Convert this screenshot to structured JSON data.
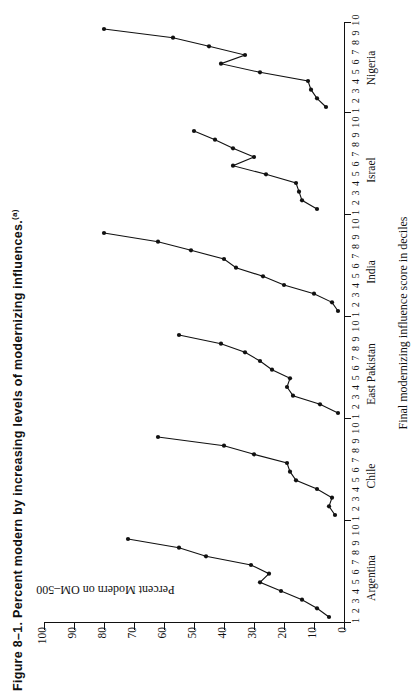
{
  "figure": {
    "number": "Figure 8–1.",
    "title": "Percent modern by increasing levels of modernizing influences.",
    "footnote_marker": "(a)"
  },
  "axes": {
    "y_label": "Percent Modern on OM–500",
    "x_label": "Final modernizing influence score in deciles",
    "y_ticks": [
      "100",
      "90",
      "80",
      "70",
      "60",
      "50",
      "40",
      "30",
      "20",
      "10",
      "0"
    ],
    "decile_labels": "1 2 3 4 5 6 7 8 9 10"
  },
  "chart_data": {
    "type": "line",
    "title": "Percent modern by increasing levels of modernizing influences.",
    "xlabel": "Final modernizing influence score in deciles",
    "ylabel": "Percent Modern on OM-500",
    "ylim": [
      0,
      100
    ],
    "xlim": [
      1,
      10
    ],
    "grid": false,
    "legend": "none",
    "panels": [
      {
        "name": "Argentina",
        "x": [
          1,
          2,
          3,
          4,
          5,
          6,
          7,
          8,
          9,
          10
        ],
        "values": [
          5,
          9,
          13,
          19,
          26,
          30,
          25,
          28,
          42,
          48,
          70
        ],
        "series": [
          {
            "name": "Argentina",
            "deciles": [
              1,
              2,
              3,
              4,
              5,
              6,
              7,
              8,
              9,
              10
            ],
            "values": [
              5,
              9,
              14,
              21,
              28,
              25,
              31,
              46,
              55,
              72
            ]
          }
        ]
      },
      {
        "name": "Chile",
        "series": [
          {
            "name": "Chile",
            "deciles": [
              1,
              2,
              3,
              4,
              5,
              6,
              7,
              8,
              9,
              10
            ],
            "values": [
              3,
              5,
              4,
              9,
              16,
              18,
              19,
              30,
              40,
              62
            ]
          }
        ]
      },
      {
        "name": "East Pakistan",
        "series": [
          {
            "name": "East Pakistan",
            "deciles": [
              1,
              2,
              3,
              4,
              5,
              6,
              7,
              8,
              9,
              10
            ],
            "values": [
              2,
              8,
              17,
              19,
              18,
              24,
              28,
              33,
              41,
              55
            ]
          }
        ]
      },
      {
        "name": "India",
        "series": [
          {
            "name": "India",
            "deciles": [
              1,
              2,
              3,
              4,
              5,
              6,
              7,
              8,
              9,
              10
            ],
            "values": [
              2,
              4,
              10,
              20,
              27,
              36,
              40,
              51,
              62,
              80
            ]
          }
        ]
      },
      {
        "name": "Israel",
        "series": [
          {
            "name": "Israel",
            "deciles": [
              1,
              2,
              3,
              4,
              5,
              6,
              7,
              8,
              9,
              10
            ],
            "values": [
              9,
              14,
              15,
              16,
              26,
              37,
              30,
              37,
              43,
              50
            ]
          }
        ]
      },
      {
        "name": "Nigeria",
        "series": [
          {
            "name": "Nigeria",
            "deciles": [
              1,
              2,
              3,
              4,
              5,
              6,
              7,
              8,
              9,
              10
            ],
            "values": [
              6,
              9,
              11,
              12,
              28,
              41,
              33,
              45,
              57,
              80
            ]
          }
        ]
      }
    ]
  }
}
